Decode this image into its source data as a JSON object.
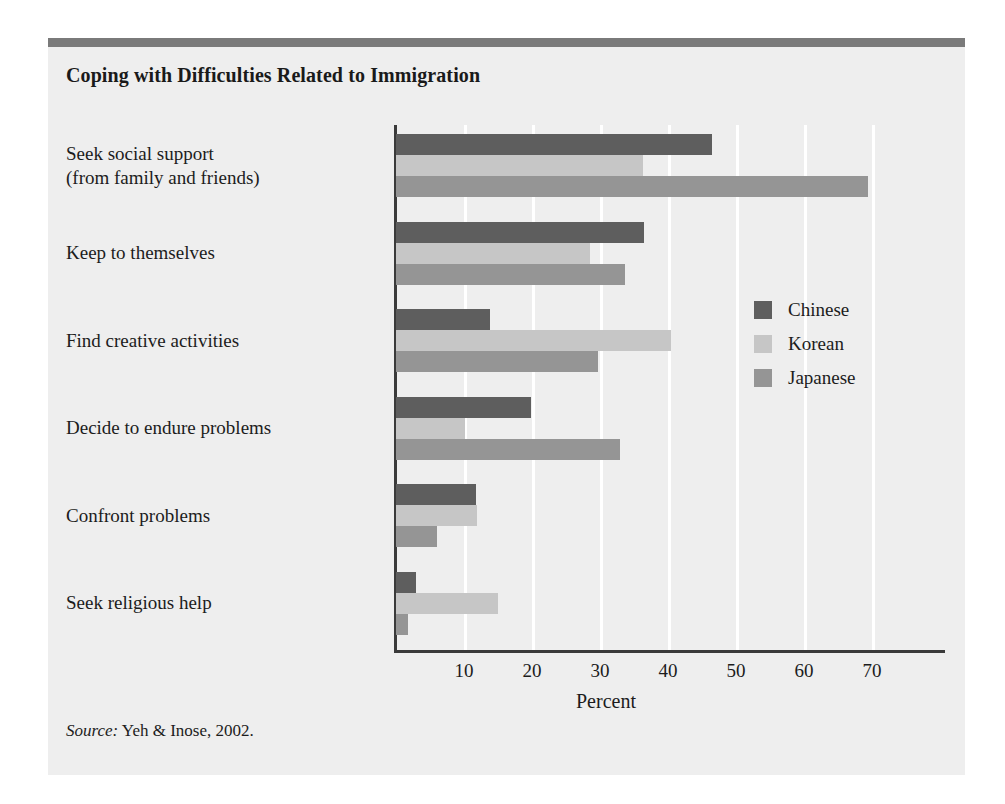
{
  "figure": {
    "title": "Coping with Difficulties Related to Immigration",
    "source_word": "Source:",
    "source_text": " Yeh & Inose, 2002.",
    "panel_bg": "#eeeeee",
    "rule_color": "#7a7a7a"
  },
  "legend": {
    "position": "inside-right",
    "items": [
      {
        "label": "Chinese",
        "color": "#5e5e5e"
      },
      {
        "label": "Korean",
        "color": "#c6c6c6"
      },
      {
        "label": "Japanese",
        "color": "#959595"
      }
    ]
  },
  "chart_data": {
    "type": "bar",
    "orientation": "horizontal",
    "title": "Coping with Difficulties Related to Immigration",
    "xlabel": "Percent",
    "ylabel": "",
    "xlim": [
      0,
      80
    ],
    "xticks": [
      10,
      20,
      30,
      40,
      50,
      60,
      70
    ],
    "xticklabels": [
      "10",
      "20",
      "30",
      "40",
      "50",
      "60",
      "70"
    ],
    "grid": true,
    "grid_axis": "x",
    "categories": [
      "Seek social support\n(from family and friends)",
      "Keep to themselves",
      "Find creative activities",
      "Decide to endure problems",
      "Confront problems",
      "Seek religious help"
    ],
    "category_lines": [
      [
        "Seek social support",
        "(from family and friends)"
      ],
      [
        "Keep to themselves"
      ],
      [
        "Find creative activities"
      ],
      [
        "Decide to endure problems"
      ],
      [
        "Confront problems"
      ],
      [
        "Seek religious help"
      ]
    ],
    "series": [
      {
        "name": "Chinese",
        "color": "#5e5e5e",
        "values": [
          46.5,
          36.5,
          13.8,
          19.8,
          11.8,
          3.0
        ]
      },
      {
        "name": "Korean",
        "color": "#c6c6c6",
        "values": [
          36.3,
          28.5,
          40.5,
          10.1,
          11.9,
          15.0
        ]
      },
      {
        "name": "Japanese",
        "color": "#959595",
        "values": [
          69.4,
          33.7,
          29.7,
          33.0,
          6.0,
          1.7
        ]
      }
    ]
  }
}
